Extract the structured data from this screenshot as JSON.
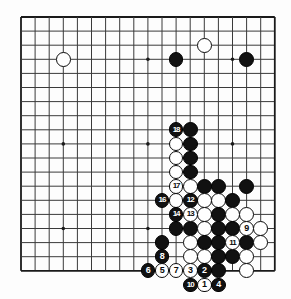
{
  "figure": {
    "kind": "go-board-diagram",
    "board_size": 19,
    "title": "",
    "caption": "",
    "colors": {
      "black_stone": "#111111",
      "white_stone": "#ffffff",
      "grid_line": "#3a3a3a",
      "border_line": "#1a1a1a",
      "background": "#fdfdfd",
      "star_point": "#1a1a1a"
    },
    "geometry": {
      "origin_x": 21,
      "origin_y": 17,
      "spacing": 14.1,
      "stone_radius": 7.4,
      "star_points": [
        [
          3,
          3
        ],
        [
          9,
          3
        ],
        [
          15,
          3
        ],
        [
          3,
          9
        ],
        [
          9,
          9
        ],
        [
          15,
          9
        ],
        [
          3,
          15
        ],
        [
          9,
          15
        ],
        [
          15,
          15
        ]
      ]
    }
  },
  "chart_data": {
    "type": "table",
    "xlabel": "board column (0-18, left to right)",
    "ylabel": "board row (0-18, top to bottom)",
    "legend": [
      "black stone",
      "white stone",
      "numbered move"
    ],
    "stones": [
      {
        "col": 3,
        "row": 3,
        "color": "white",
        "label": ""
      },
      {
        "col": 11,
        "row": 3,
        "color": "black",
        "label": ""
      },
      {
        "col": 13,
        "row": 2,
        "color": "white",
        "label": ""
      },
      {
        "col": 16,
        "row": 3,
        "color": "black",
        "label": ""
      },
      {
        "col": 11,
        "row": 8,
        "color": "black",
        "label": "18"
      },
      {
        "col": 12,
        "row": 8,
        "color": "black",
        "label": ""
      },
      {
        "col": 11,
        "row": 9,
        "color": "white",
        "label": ""
      },
      {
        "col": 12,
        "row": 9,
        "color": "black",
        "label": ""
      },
      {
        "col": 11,
        "row": 10,
        "color": "white",
        "label": ""
      },
      {
        "col": 12,
        "row": 10,
        "color": "black",
        "label": ""
      },
      {
        "col": 11,
        "row": 11,
        "color": "white",
        "label": ""
      },
      {
        "col": 12,
        "row": 11,
        "color": "black",
        "label": ""
      },
      {
        "col": 11,
        "row": 12,
        "color": "white",
        "label": "17"
      },
      {
        "col": 12,
        "row": 12,
        "color": "white",
        "label": ""
      },
      {
        "col": 13,
        "row": 12,
        "color": "black",
        "label": ""
      },
      {
        "col": 14,
        "row": 12,
        "color": "black",
        "label": ""
      },
      {
        "col": 16,
        "row": 12,
        "color": "black",
        "label": ""
      },
      {
        "col": 10,
        "row": 13,
        "color": "black",
        "label": "16"
      },
      {
        "col": 11,
        "row": 13,
        "color": "white",
        "label": ""
      },
      {
        "col": 12,
        "row": 13,
        "color": "black",
        "label": "12"
      },
      {
        "col": 13,
        "row": 13,
        "color": "white",
        "label": ""
      },
      {
        "col": 14,
        "row": 13,
        "color": "white",
        "label": ""
      },
      {
        "col": 15,
        "row": 13,
        "color": "black",
        "label": ""
      },
      {
        "col": 11,
        "row": 14,
        "color": "black",
        "label": "14"
      },
      {
        "col": 12,
        "row": 14,
        "color": "white",
        "label": "13"
      },
      {
        "col": 13,
        "row": 14,
        "color": "white",
        "label": ""
      },
      {
        "col": 14,
        "row": 14,
        "color": "black",
        "label": ""
      },
      {
        "col": 15,
        "row": 14,
        "color": "white",
        "label": ""
      },
      {
        "col": 16,
        "row": 14,
        "color": "white",
        "label": ""
      },
      {
        "col": 11,
        "row": 15,
        "color": "black",
        "label": ""
      },
      {
        "col": 12,
        "row": 15,
        "color": "black",
        "label": ""
      },
      {
        "col": 13,
        "row": 15,
        "color": "white",
        "label": ""
      },
      {
        "col": 14,
        "row": 15,
        "color": "black",
        "label": ""
      },
      {
        "col": 15,
        "row": 15,
        "color": "black",
        "label": ""
      },
      {
        "col": 16,
        "row": 15,
        "color": "white",
        "label": "9"
      },
      {
        "col": 17,
        "row": 15,
        "color": "white",
        "label": ""
      },
      {
        "col": 10,
        "row": 16,
        "color": "black",
        "label": ""
      },
      {
        "col": 12,
        "row": 16,
        "color": "white",
        "label": ""
      },
      {
        "col": 13,
        "row": 16,
        "color": "black",
        "label": ""
      },
      {
        "col": 14,
        "row": 16,
        "color": "black",
        "label": ""
      },
      {
        "col": 15,
        "row": 16,
        "color": "white",
        "label": "11"
      },
      {
        "col": 16,
        "row": 16,
        "color": "black",
        "label": ""
      },
      {
        "col": 17,
        "row": 16,
        "color": "white",
        "label": ""
      },
      {
        "col": 10,
        "row": 17,
        "color": "black",
        "label": "8"
      },
      {
        "col": 12,
        "row": 17,
        "color": "white",
        "label": ""
      },
      {
        "col": 13,
        "row": 17,
        "color": "white",
        "label": ""
      },
      {
        "col": 14,
        "row": 17,
        "color": "black",
        "label": ""
      },
      {
        "col": 15,
        "row": 17,
        "color": "black",
        "label": ""
      },
      {
        "col": 16,
        "row": 17,
        "color": "white",
        "label": ""
      },
      {
        "col": 9,
        "row": 18,
        "color": "black",
        "label": "6"
      },
      {
        "col": 10,
        "row": 18,
        "color": "white",
        "label": "5"
      },
      {
        "col": 11,
        "row": 18,
        "color": "white",
        "label": "7"
      },
      {
        "col": 12,
        "row": 18,
        "color": "white",
        "label": "3"
      },
      {
        "col": 13,
        "row": 18,
        "color": "black",
        "label": "2"
      },
      {
        "col": 14,
        "row": 18,
        "color": "black",
        "label": ""
      },
      {
        "col": 16,
        "row": 18,
        "color": "white",
        "label": ""
      },
      {
        "col": 12,
        "row": 19,
        "color": "black",
        "label": "10"
      },
      {
        "col": 13,
        "row": 19,
        "color": "white",
        "label": "1"
      },
      {
        "col": 14,
        "row": 19,
        "color": "black",
        "label": "4"
      }
    ],
    "move_sequence": [
      {
        "move": 1,
        "color": "white"
      },
      {
        "move": 2,
        "color": "black"
      },
      {
        "move": 3,
        "color": "white"
      },
      {
        "move": 4,
        "color": "black"
      },
      {
        "move": 5,
        "color": "white"
      },
      {
        "move": 6,
        "color": "black"
      },
      {
        "move": 7,
        "color": "white"
      },
      {
        "move": 8,
        "color": "black"
      },
      {
        "move": 9,
        "color": "white"
      },
      {
        "move": 10,
        "color": "black"
      },
      {
        "move": 11,
        "color": "white"
      },
      {
        "move": 12,
        "color": "black"
      },
      {
        "move": 13,
        "color": "white"
      },
      {
        "move": 14,
        "color": "black"
      },
      {
        "move": 16,
        "color": "black"
      },
      {
        "move": 17,
        "color": "white"
      },
      {
        "move": 18,
        "color": "black"
      }
    ]
  }
}
